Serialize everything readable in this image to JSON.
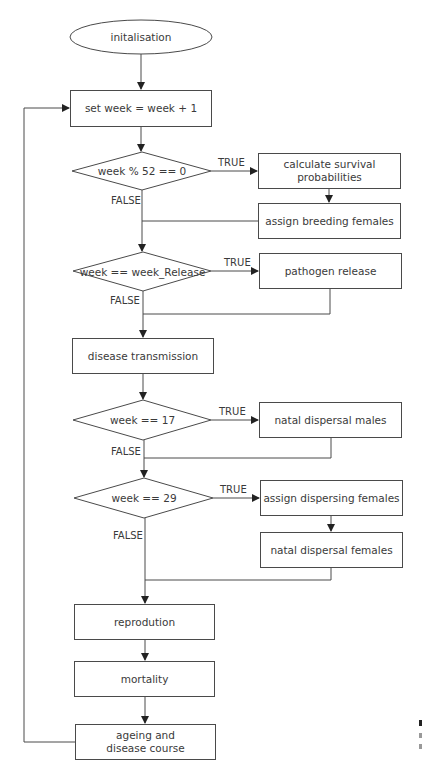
{
  "diagram": {
    "type": "flowchart",
    "start": {
      "label": "initalisation"
    },
    "steps": {
      "increment_week": "set week = week + 1",
      "survival": "calculate survival probabilities",
      "breeding": "assign breeding females",
      "pathogen": "pathogen release",
      "transmission": "disease transmission",
      "dispersal_males": "natal dispersal males",
      "assign_dispersing": "assign dispersing females",
      "dispersal_females": "natal dispersal females",
      "reproduction": "reprodution",
      "mortality": "mortality",
      "ageing_line1": "ageing and",
      "ageing_line2": "disease course"
    },
    "decisions": {
      "d1": "week % 52 == 0",
      "d2": "week == week_Release",
      "d3": "week == 17",
      "d4": "week == 29"
    },
    "edge_labels": {
      "true": "TRUE",
      "false": "FALSE"
    },
    "colors": {
      "stroke": "#4a4a4a",
      "text": "#3a3a3a",
      "background": "#ffffff"
    }
  }
}
